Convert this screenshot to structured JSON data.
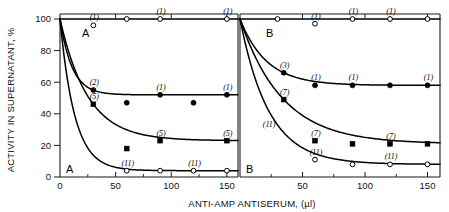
{
  "chart_data": {
    "type": "line",
    "title": "",
    "xlabel": "ANTI-AMP ANTISERUM, (µl)",
    "ylabel": "ACTIVITY IN SUPERNATANT, %",
    "xlim": [
      0,
      160
    ],
    "ylim": [
      0,
      104
    ],
    "xticks": [
      0,
      50,
      100,
      150
    ],
    "xtick_labels": [
      "0",
      "50",
      "100",
      "150"
    ],
    "xticks_minor": [
      25,
      75,
      125
    ],
    "yticks": [
      0,
      20,
      40,
      60,
      80,
      100
    ],
    "ytick_labels": [
      "0",
      "20",
      "40",
      "60",
      "80",
      "100"
    ],
    "grid": false,
    "legend": "none",
    "panels": [
      {
        "id": "A",
        "letter_top": "A",
        "letter_bottom": "A",
        "series": [
          {
            "name": "control-open-circle",
            "marker": "open-circle",
            "plateau": 100,
            "points": [
              {
                "x": 0,
                "y": 100,
                "label": "",
                "marker": "none"
              },
              {
                "x": 30,
                "y": 96,
                "label": "(1)",
                "marker": "open-circle",
                "offset": "below"
              },
              {
                "x": 60,
                "y": 100,
                "label": "",
                "marker": "open-circle",
                "offset": "on"
              },
              {
                "x": 90,
                "y": 100,
                "label": "(1)",
                "marker": "open-circle",
                "offset": "on"
              },
              {
                "x": 150,
                "y": 100,
                "label": "(1)",
                "marker": "open-circle",
                "offset": "on"
              }
            ]
          },
          {
            "name": "filled-circle-series",
            "marker": "filled-circle",
            "plateau": 52,
            "points": [
              {
                "x": 0,
                "y": 100,
                "label": "",
                "marker": "none"
              },
              {
                "x": 30,
                "y": 55,
                "label": "(2)",
                "marker": "filled-circle",
                "offset": "on"
              },
              {
                "x": 60,
                "y": 47,
                "label": "",
                "marker": "filled-circle",
                "offset": "below"
              },
              {
                "x": 90,
                "y": 52,
                "label": "(1)",
                "marker": "filled-circle",
                "offset": "on"
              },
              {
                "x": 120,
                "y": 47,
                "label": "",
                "marker": "filled-circle",
                "offset": "below"
              },
              {
                "x": 150,
                "y": 52,
                "label": "(1)",
                "marker": "filled-circle",
                "offset": "on"
              }
            ]
          },
          {
            "name": "filled-square-series",
            "marker": "filled-square",
            "plateau": 23,
            "points": [
              {
                "x": 0,
                "y": 100,
                "label": "",
                "marker": "none"
              },
              {
                "x": 30,
                "y": 46,
                "label": "(5)",
                "marker": "filled-square",
                "offset": "on"
              },
              {
                "x": 60,
                "y": 18,
                "label": "",
                "marker": "filled-square",
                "offset": "below"
              },
              {
                "x": 90,
                "y": 23,
                "label": "(5)",
                "marker": "filled-square",
                "offset": "on"
              },
              {
                "x": 150,
                "y": 23,
                "label": "(5)",
                "marker": "filled-square",
                "offset": "on"
              }
            ]
          },
          {
            "name": "open-circle-low-series",
            "marker": "open-circle",
            "plateau": 4,
            "points": [
              {
                "x": 0,
                "y": 100,
                "label": "",
                "marker": "none"
              },
              {
                "x": 60,
                "y": 4,
                "label": "(11)",
                "marker": "open-circle",
                "offset": "on"
              },
              {
                "x": 90,
                "y": 4,
                "label": "",
                "marker": "open-circle",
                "offset": "on"
              },
              {
                "x": 120,
                "y": 4,
                "label": "(11)",
                "marker": "open-circle",
                "offset": "on"
              },
              {
                "x": 150,
                "y": 4,
                "label": "",
                "marker": "open-circle",
                "offset": "on"
              }
            ]
          }
        ]
      },
      {
        "id": "B",
        "letter_top": "B",
        "letter_bottom": "B",
        "series": [
          {
            "name": "control-open-circle",
            "marker": "open-circle",
            "plateau": 100,
            "points": [
              {
                "x": 0,
                "y": 100,
                "label": "",
                "marker": "none"
              },
              {
                "x": 30,
                "y": 100,
                "label": "",
                "marker": "open-circle",
                "offset": "on"
              },
              {
                "x": 60,
                "y": 97,
                "label": "(1)",
                "marker": "open-circle",
                "offset": "below"
              },
              {
                "x": 90,
                "y": 100,
                "label": "(1)",
                "marker": "open-circle",
                "offset": "on"
              },
              {
                "x": 120,
                "y": 100,
                "label": "(1)",
                "marker": "open-circle",
                "offset": "on"
              },
              {
                "x": 150,
                "y": 100,
                "label": "",
                "marker": "open-circle",
                "offset": "on"
              }
            ]
          },
          {
            "name": "filled-circle-series",
            "marker": "filled-circle",
            "plateau": 58,
            "points": [
              {
                "x": 0,
                "y": 100,
                "label": "",
                "marker": "none"
              },
              {
                "x": 35,
                "y": 66,
                "label": "(3)",
                "marker": "filled-circle",
                "offset": "on"
              },
              {
                "x": 60,
                "y": 58,
                "label": "(1)",
                "marker": "filled-circle",
                "offset": "on"
              },
              {
                "x": 90,
                "y": 58,
                "label": "(1)",
                "marker": "filled-circle",
                "offset": "on"
              },
              {
                "x": 120,
                "y": 58,
                "label": "",
                "marker": "filled-circle",
                "offset": "on"
              },
              {
                "x": 150,
                "y": 58,
                "label": "(1)",
                "marker": "filled-circle",
                "offset": "on"
              }
            ]
          },
          {
            "name": "filled-square-series",
            "marker": "filled-square",
            "plateau": 21,
            "points": [
              {
                "x": 0,
                "y": 100,
                "label": "",
                "marker": "none"
              },
              {
                "x": 35,
                "y": 49,
                "label": "(7)",
                "marker": "filled-square",
                "offset": "on"
              },
              {
                "x": 60,
                "y": 23,
                "label": "(7)",
                "marker": "filled-square",
                "offset": "on"
              },
              {
                "x": 90,
                "y": 21,
                "label": "",
                "marker": "filled-square",
                "offset": "on"
              },
              {
                "x": 120,
                "y": 21,
                "label": "(7)",
                "marker": "filled-square",
                "offset": "on"
              },
              {
                "x": 150,
                "y": 21,
                "label": "",
                "marker": "filled-square",
                "offset": "on"
              }
            ]
          },
          {
            "name": "open-circle-low-series",
            "marker": "open-circle",
            "plateau": 8,
            "points": [
              {
                "x": 0,
                "y": 100,
                "label": "",
                "marker": "none"
              },
              {
                "x": 30,
                "y": 33,
                "label": "(11)",
                "marker": "none",
                "offset": "on"
              },
              {
                "x": 60,
                "y": 11,
                "label": "(11)",
                "marker": "open-circle",
                "offset": "on"
              },
              {
                "x": 90,
                "y": 8,
                "label": "",
                "marker": "open-circle",
                "offset": "on"
              },
              {
                "x": 120,
                "y": 8,
                "label": "(11)",
                "marker": "open-circle",
                "offset": "on"
              },
              {
                "x": 150,
                "y": 8,
                "label": "",
                "marker": "open-circle",
                "offset": "on"
              }
            ]
          }
        ]
      }
    ]
  }
}
